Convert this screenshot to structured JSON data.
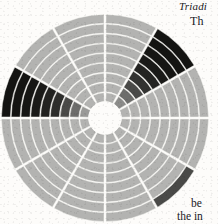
{
  "page": {
    "width": 218,
    "height": 224,
    "background_color": "#fdfcfa",
    "ink_color": "#20201e"
  },
  "margin_text": {
    "title": "Triadi",
    "subtitle": "Th",
    "body_line_1": "be",
    "body_line_2": "the in"
  },
  "chart_data": {
    "type": "pie",
    "subtype": "polar-area-matrix",
    "title": "Triadi",
    "xlabel": "",
    "ylabel": "",
    "grid": true,
    "legend_position": "none",
    "center": {
      "x": 105,
      "y": 118
    },
    "inner_radius": 16,
    "outer_radius": 104,
    "n_sectors": 12,
    "n_rings": 9,
    "rotation_deg": -90,
    "sector_angle_deg": 30,
    "separator_color": "#f7f6f2",
    "separator_width": 2.1,
    "hub_color": "#fdfcfa",
    "palette": {
      "light": "#b3b3b1",
      "light_alt": "#b8b8b6",
      "mid": "#9a9a98",
      "dark_mid": "#6d6d6b",
      "dark": "#4a4a48",
      "darker": "#333331",
      "near_black": "#1e1e1c",
      "black": "#141412"
    },
    "categories": [
      "S1",
      "S2",
      "S3",
      "S4",
      "S5",
      "S6",
      "S7",
      "S8",
      "S9",
      "S10",
      "S11",
      "S12"
    ],
    "ring_labels": [
      "R1",
      "R2",
      "R3",
      "R4",
      "R5",
      "R6",
      "R7",
      "R8",
      "R9"
    ],
    "cells": [
      {
        "sector": 0,
        "values": [
          "#b3b3b1",
          "#b3b3b1",
          "#b3b3b1",
          "#b3b3b1",
          "#b3b3b1",
          "#b3b3b1",
          "#b3b3b1",
          "#b3b3b1",
          "#b3b3b1"
        ]
      },
      {
        "sector": 1,
        "values": [
          "#8c8c8a",
          "#6d6d6b",
          "#4a4a48",
          "#333331",
          "#242422",
          "#1a1a18",
          "#161614",
          "#141412",
          "#141412"
        ]
      },
      {
        "sector": 2,
        "values": [
          "#b3b3b1",
          "#b3b3b1",
          "#b3b3b1",
          "#b3b3b1",
          "#b3b3b1",
          "#b3b3b1",
          "#b3b3b1",
          "#b3b3b1",
          "#b3b3b1"
        ]
      },
      {
        "sector": 3,
        "values": [
          "#b3b3b1",
          "#b3b3b1",
          "#b3b3b1",
          "#b3b3b1",
          "#b3b3b1",
          "#b3b3b1",
          "#b3b3b1",
          "#b3b3b1",
          "#b3b3b1"
        ]
      },
      {
        "sector": 4,
        "values": [
          "#b3b3b1",
          "#b3b3b1",
          "#b3b3b1",
          "#b3b3b1",
          "#b3b3b1",
          "#b3b3b1",
          "#b3b3b1",
          "#b3b3b1",
          "#4a4a48"
        ]
      },
      {
        "sector": 5,
        "values": [
          "#b3b3b1",
          "#b3b3b1",
          "#b3b3b1",
          "#b3b3b1",
          "#b3b3b1",
          "#b3b3b1",
          "#b3b3b1",
          "#b3b3b1",
          "#b3b3b1"
        ]
      },
      {
        "sector": 6,
        "values": [
          "#b3b3b1",
          "#b3b3b1",
          "#b3b3b1",
          "#b3b3b1",
          "#b3b3b1",
          "#b3b3b1",
          "#b3b3b1",
          "#b3b3b1",
          "#b3b3b1"
        ]
      },
      {
        "sector": 7,
        "values": [
          "#b3b3b1",
          "#b3b3b1",
          "#b3b3b1",
          "#b3b3b1",
          "#b3b3b1",
          "#b3b3b1",
          "#b3b3b1",
          "#b3b3b1",
          "#b3b3b1"
        ]
      },
      {
        "sector": 8,
        "values": [
          "#b3b3b1",
          "#b3b3b1",
          "#b3b3b1",
          "#b3b3b1",
          "#b3b3b1",
          "#b3b3b1",
          "#b3b3b1",
          "#b3b3b1",
          "#b3b3b1"
        ]
      },
      {
        "sector": 9,
        "values": [
          "#9a9a98",
          "#6d6d6b",
          "#4a4a48",
          "#2e2e2c",
          "#222220",
          "#1a1a18",
          "#161614",
          "#141412",
          "#141412"
        ]
      },
      {
        "sector": 10,
        "values": [
          "#b3b3b1",
          "#b3b3b1",
          "#b3b3b1",
          "#b3b3b1",
          "#b3b3b1",
          "#b3b3b1",
          "#b3b3b1",
          "#b3b3b1",
          "#b3b3b1"
        ]
      },
      {
        "sector": 11,
        "values": [
          "#b3b3b1",
          "#b3b3b1",
          "#b3b3b1",
          "#b3b3b1",
          "#b3b3b1",
          "#b3b3b1",
          "#b3b3b1",
          "#b3b3b1",
          "#b3b3b1"
        ]
      }
    ]
  }
}
